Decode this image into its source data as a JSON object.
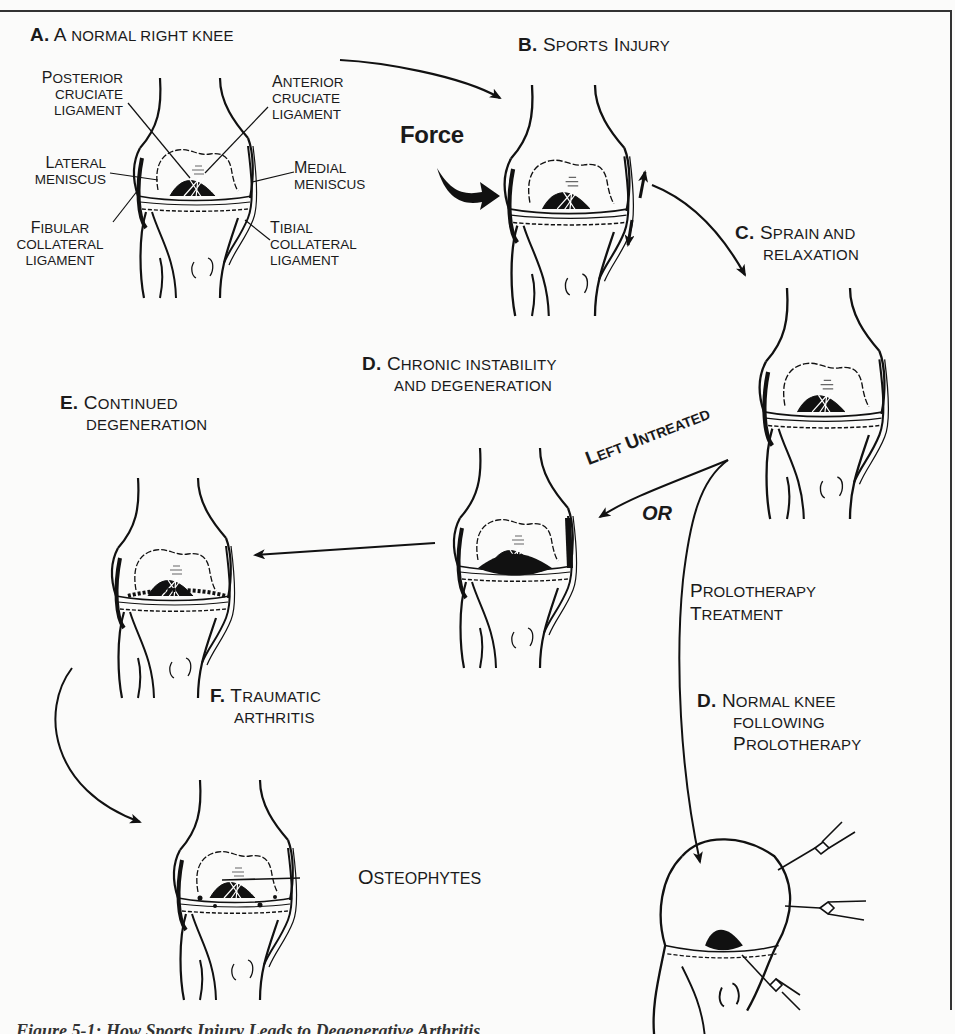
{
  "figure": {
    "panels": {
      "a": {
        "letter": "A.",
        "title_first": "A",
        "title_rest": "NORMAL RIGHT KNEE"
      },
      "b": {
        "letter": "B.",
        "title_cap1": "S",
        "title_rest1": "PORTS",
        "title_cap2": "I",
        "title_rest2": "NJURY"
      },
      "c": {
        "letter": "C.",
        "line1_cap": "S",
        "line1_rest": "PRAIN AND",
        "line2": "RELAXATION"
      },
      "d_chronic": {
        "letter": "D.",
        "line1_cap": "C",
        "line1_rest": "HRONIC INSTABILITY",
        "line2": "AND DEGENERATION"
      },
      "e": {
        "letter": "E.",
        "line1_cap": "C",
        "line1_rest": "ONTINUED",
        "line2": "DEGENERATION"
      },
      "f": {
        "letter": "F.",
        "line1_cap": "T",
        "line1_rest": "RAUMATIC",
        "line2": "ARTHRITIS"
      },
      "d_normal": {
        "letter": "D.",
        "line1_cap": "N",
        "line1_rest": "ORMAL KNEE",
        "line2": "FOLLOWING",
        "line3_cap": "P",
        "line3_rest": "ROLOTHERAPY"
      }
    },
    "anatomy_labels": {
      "posterior_cruciate": {
        "cap": "P",
        "l1": "OSTERIOR",
        "l2": "CRUCIATE",
        "l3": "LIGAMENT"
      },
      "anterior_cruciate": {
        "cap": "A",
        "l1": "NTERIOR",
        "l2": "CRUCIATE",
        "l3": "LIGAMENT"
      },
      "lateral_meniscus": {
        "cap": "L",
        "l1": "ATERAL",
        "l2": "MENISCUS"
      },
      "medial_meniscus": {
        "cap": "M",
        "l1": "EDIAL",
        "l2": "MENISCUS"
      },
      "fibular_collateral": {
        "cap": "F",
        "l1": "IBULAR",
        "l2": "COLLATERAL",
        "l3": "LIGAMENT"
      },
      "tibial_collateral": {
        "cap": "T",
        "l1": "IBIAL",
        "l2": "COLLATERAL",
        "l3": "LIGAMENT"
      },
      "osteophytes": {
        "cap": "O",
        "rest": "STEOPHYTES"
      }
    },
    "annotations": {
      "force": "Force",
      "left_untreated_cap1": "L",
      "left_untreated_rest1": "EFT",
      "left_untreated_cap2": "U",
      "left_untreated_rest2": "NTREATED",
      "or": "OR",
      "prolo_cap1": "P",
      "prolo_rest1": "ROLOTHERAPY",
      "prolo_cap2": "T",
      "prolo_rest2": "REATMENT"
    },
    "caption": "Figure 5-1: How Sports Injury Leads to Degenerative Arthritis"
  }
}
